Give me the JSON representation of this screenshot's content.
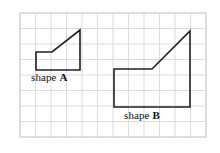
{
  "figure": {
    "kind": "geometry-grid-figure",
    "background_color": "#ffffff",
    "grid": {
      "line_color": "#dcdce2",
      "border_color": "#d2d2d8",
      "cell_size_px": 15.5,
      "columns": 12,
      "rows": 8,
      "origin_x_px": 20,
      "origin_y_px": 13,
      "width_px": 186,
      "height_px": 124
    },
    "stroke_color": "#231f20",
    "stroke_width_px": 1.6,
    "shapes": [
      {
        "id": "shape-a",
        "label_text": "shape ",
        "label_bold_letter": "A",
        "label_full": "shape A",
        "grid_units": {
          "width": 3,
          "height": 1.25,
          "slant_rise": 1.5
        },
        "points_px": "36,70 36,52 52,52 80,30 80,70 36,70",
        "vertices_px": [
          {
            "name": "bottom-left",
            "x": 36,
            "y": 70
          },
          {
            "name": "top-left",
            "x": 36,
            "y": 52
          },
          {
            "name": "bend",
            "x": 52,
            "y": 52
          },
          {
            "name": "apex-top-right",
            "x": 80,
            "y": 30
          },
          {
            "name": "bottom-right",
            "x": 80,
            "y": 70
          }
        ]
      },
      {
        "id": "shape-b",
        "label_text": "shape ",
        "label_bold_letter": "B",
        "label_full": "shape B",
        "grid_units": {
          "width": 5,
          "height": 2.5,
          "slant_rise": 2.5
        },
        "points_px": "114,107 114,69 152,69 190,31 190,107 114,107",
        "vertices_px": [
          {
            "name": "bottom-left",
            "x": 114,
            "y": 107
          },
          {
            "name": "top-left",
            "x": 114,
            "y": 69
          },
          {
            "name": "bend",
            "x": 152,
            "y": 69
          },
          {
            "name": "apex-top-right",
            "x": 190,
            "y": 31
          },
          {
            "name": "bottom-right",
            "x": 190,
            "y": 107
          }
        ]
      }
    ]
  }
}
